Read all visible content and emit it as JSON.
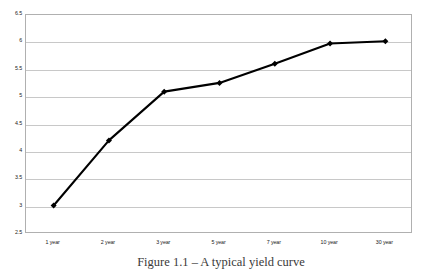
{
  "chart_data": {
    "type": "line",
    "title": "",
    "xlabel": "",
    "ylabel": "",
    "categories": [
      "1 year",
      "2 year",
      "3 year",
      "5 year",
      "7 year",
      "10 year",
      "30 year"
    ],
    "values": [
      3.02,
      4.21,
      5.1,
      5.26,
      5.61,
      5.98,
      6.02
    ],
    "series": [
      {
        "name": "yield",
        "values": [
          3.02,
          4.21,
          5.1,
          5.26,
          5.61,
          5.98,
          6.02
        ]
      }
    ],
    "ylim": [
      2.5,
      6.5
    ],
    "ytick_labels": [
      "6.5",
      "6",
      "5.5",
      "5",
      "4.5",
      "4",
      "3.5",
      "3",
      "2.5"
    ],
    "ytick_values": [
      6.5,
      6,
      5.5,
      5,
      4.5,
      4,
      3.5,
      3,
      2.5
    ],
    "grid": "horizontal",
    "legend": "none",
    "marker": "diamond",
    "line_color": "#000000",
    "marker_color": "#000000",
    "grid_color": "#c8c8c8",
    "frame_color": "#b0b0b0",
    "background": "#ffffff"
  },
  "caption": {
    "text": "Figure 1.1 – A typical yield curve"
  }
}
